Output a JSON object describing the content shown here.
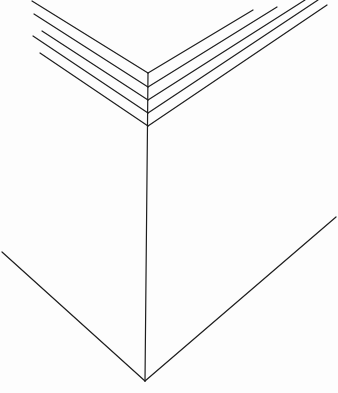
{
  "drawing": {
    "description": "Line drawing of a box corner with stacked layered top edges",
    "stroke_color": "#1e1e1e",
    "background": "#fdfdfd",
    "top_layers": [
      {
        "left": [
          32,
          1
        ],
        "vertex": [
          148,
          73
        ],
        "right": [
          253,
          10
        ]
      },
      {
        "left": [
          34,
          14
        ],
        "vertex": [
          148,
          87
        ],
        "right": [
          277,
          7
        ]
      },
      {
        "left": [
          42,
          31
        ],
        "vertex": [
          148,
          100
        ],
        "right": [
          305,
          0
        ]
      },
      {
        "left": [
          33,
          36
        ],
        "vertex": [
          148,
          113
        ],
        "right": [
          318,
          0
        ]
      },
      {
        "left": [
          40,
          53
        ],
        "vertex": [
          148,
          126
        ],
        "right": [
          327,
          5
        ]
      }
    ],
    "vertical_edge": {
      "top": [
        148,
        73
      ],
      "bottom": [
        145,
        381
      ]
    },
    "bottom_left_edge": {
      "start": [
        2,
        252
      ],
      "end": [
        145,
        381
      ]
    },
    "bottom_right_edge": {
      "start": [
        145,
        381
      ],
      "end": [
        336,
        217
      ]
    }
  }
}
